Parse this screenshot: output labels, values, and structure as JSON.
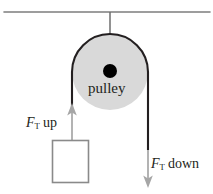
{
  "figure": {
    "canvas": {
      "width": 213,
      "height": 194,
      "background": "#ffffff"
    },
    "labels": {
      "pulley": "pulley",
      "tension_up_symbol": "F",
      "tension_up_subscript": "T",
      "tension_up_direction": "up",
      "tension_up_full": "F_T up",
      "tension_down_symbol": "F",
      "tension_down_subscript": "T",
      "tension_down_direction": "down",
      "tension_down_full": "F_T down"
    },
    "colors": {
      "ceiling_line": "#7d7d7d",
      "support_line": "#6e6e6e",
      "pulley_fill": "#d9d9d9",
      "pulley_edge": "#231f20",
      "hub_fill": "#000000",
      "rope": "#231f20",
      "arrow": "#a6a6a6",
      "box_stroke": "#8a8a8a",
      "box_fill": "#ffffff",
      "text": "#231f20"
    },
    "geometry": {
      "ceiling_y": 12,
      "ceiling_x_start": 4,
      "ceiling_x_end": 210,
      "support_x": 110,
      "pulley_center_x": 110,
      "pulley_center_y": 72,
      "pulley_radius": 38,
      "hub_radius": 7,
      "rope_left_x": 72,
      "rope_right_x": 148,
      "arrow_up_tip_y": 104,
      "arrow_up_tail_y": 140,
      "arrow_down_tip_y": 187,
      "arrow_down_tail_y": 150,
      "box_left": 52,
      "box_top": 140,
      "box_width": 36,
      "box_height": 42
    }
  }
}
